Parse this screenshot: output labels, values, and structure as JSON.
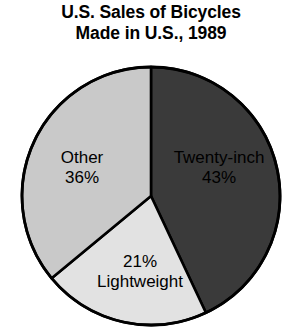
{
  "title": {
    "line1": "U.S. Sales of Bicycles",
    "line2": "Made in U.S., 1989"
  },
  "labels": {
    "twenty_inch_name": "Twenty-inch",
    "twenty_inch_value": "43%",
    "other_name": "Other",
    "other_value": "36%",
    "lightweight_name": "Lightweight",
    "lightweight_value": "21%"
  },
  "colors": {
    "twenty_inch": "#3a3a3a",
    "lightweight": "#e2e2e2",
    "other": "#c9c9c9",
    "outline": "#000000",
    "background": "#ffffff",
    "text": "#000000"
  },
  "chart_data": {
    "type": "pie",
    "title": "U.S. Sales of Bicycles Made in U.S., 1989",
    "subtitle": "",
    "xlabel": "",
    "ylabel": "",
    "categories": [
      "Twenty-inch",
      "Lightweight",
      "Other"
    ],
    "values": [
      43,
      21,
      36
    ],
    "value_labels": [
      "43%",
      "21%",
      "36%"
    ],
    "units": "percent",
    "total": 100,
    "slice_colors": [
      "#3a3a3a",
      "#e2e2e2",
      "#c9c9c9"
    ],
    "start_angle_deg": 0,
    "direction": "clockwise",
    "labels_position": "inside-slices",
    "legend": false,
    "grid": false,
    "slices": [
      {
        "name": "Twenty-inch",
        "value": 43,
        "label": "43%",
        "color": "#3a3a3a",
        "angle_start_deg": 0,
        "angle_end_deg": 154.8
      },
      {
        "name": "Lightweight",
        "value": 21,
        "label": "21%",
        "color": "#e2e2e2",
        "angle_start_deg": 154.8,
        "angle_end_deg": 230.4
      },
      {
        "name": "Other",
        "value": 36,
        "label": "36%",
        "color": "#c9c9c9",
        "angle_start_deg": 230.4,
        "angle_end_deg": 360.0
      }
    ]
  }
}
